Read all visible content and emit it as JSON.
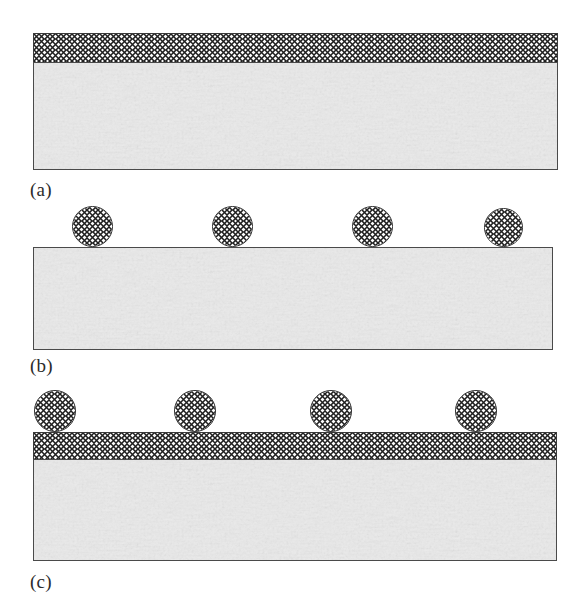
{
  "figure": {
    "background_color": "#ffffff",
    "width": 585,
    "height": 613
  },
  "style": {
    "substrate_fill": "#ebebeb",
    "substrate_stroke": "#4a4a4a",
    "hatch_fill": "#fdfdfd",
    "hatch_stroke": "#3a3a3a",
    "hatch_line_color": "#1f1f1f",
    "particle_stroke": "#2e2e2e",
    "caption_color": "#2b2b2b",
    "hatch_pitch_px": 11
  },
  "panels": [
    {
      "id": "a",
      "caption": "(a)",
      "caption_x": 30,
      "caption_y": 180,
      "substrate": {
        "x": 33,
        "y": 62,
        "width": 525,
        "height": 108
      },
      "coating": {
        "x": 33,
        "y": 33,
        "width": 525,
        "height": 30
      },
      "particles": []
    },
    {
      "id": "b",
      "caption": "(b)",
      "caption_x": 30,
      "caption_y": 356,
      "substrate": {
        "x": 33,
        "y": 247,
        "width": 520,
        "height": 103
      },
      "coating": null,
      "particles": [
        {
          "cx": 92,
          "cy": 226,
          "d": 41
        },
        {
          "cx": 232,
          "cy": 226,
          "d": 41
        },
        {
          "cx": 372,
          "cy": 226,
          "d": 41
        },
        {
          "cx": 503,
          "cy": 227,
          "d": 39
        }
      ]
    },
    {
      "id": "c",
      "caption": "(c)",
      "caption_x": 30,
      "caption_y": 572,
      "substrate": {
        "x": 33,
        "y": 459,
        "width": 524,
        "height": 102
      },
      "coating": {
        "x": 33,
        "y": 432,
        "width": 524,
        "height": 28
      },
      "particles": [
        {
          "cx": 55,
          "cy": 411,
          "d": 42
        },
        {
          "cx": 195,
          "cy": 411,
          "d": 42
        },
        {
          "cx": 331,
          "cy": 411,
          "d": 42
        },
        {
          "cx": 476,
          "cy": 411,
          "d": 42
        }
      ]
    }
  ]
}
